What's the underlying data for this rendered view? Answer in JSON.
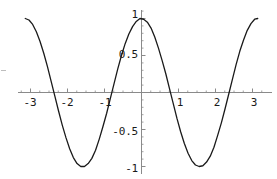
{
  "chart_data": {
    "type": "line",
    "title": "",
    "subtitle": "",
    "xlabel": "",
    "ylabel": "",
    "function": "cos(2x)",
    "xlim": [
      -3.4,
      3.4
    ],
    "ylim": [
      -1.18,
      1.18
    ],
    "grid": false,
    "legend": null,
    "axis_style": "crossed-at-origin",
    "x_ticks": [
      -3,
      -2,
      -1,
      1,
      2,
      3
    ],
    "x_tick_labels": [
      "-3",
      "-2",
      "-1",
      "1",
      "2",
      "3"
    ],
    "y_ticks": [
      1,
      0.5,
      -0.5,
      -1
    ],
    "y_tick_labels": [
      "1",
      "0.5",
      "-0.5",
      "-1"
    ],
    "x_minor_tick_step": 0.25,
    "y_minor_tick_step": 0.1,
    "series": [
      {
        "name": "cos(2x)",
        "color": "#1a1a1a",
        "width": 1.3,
        "x": [
          -3.1416,
          -3.0416,
          -2.9416,
          -2.8416,
          -2.7416,
          -2.6416,
          -2.5416,
          -2.4416,
          -2.3416,
          -2.2416,
          -2.1416,
          -2.0416,
          -1.9416,
          -1.8416,
          -1.7416,
          -1.6416,
          -1.5416,
          -1.4416,
          -1.3416,
          -1.2416,
          -1.1416,
          -1.0416,
          -0.9416,
          -0.8416,
          -0.7416,
          -0.6416,
          -0.5416,
          -0.4416,
          -0.3416,
          -0.2416,
          -0.1416,
          -0.0416,
          0.0584,
          0.1584,
          0.2584,
          0.3584,
          0.4584,
          0.5584,
          0.6584,
          0.7584,
          0.8584,
          0.9584,
          1.0584,
          1.1584,
          1.2584,
          1.3584,
          1.4584,
          1.5584,
          1.6584,
          1.7584,
          1.8584,
          1.9584,
          2.0584,
          2.1584,
          2.2584,
          2.3584,
          2.4584,
          2.5584,
          2.6584,
          2.7584,
          2.8584,
          2.9584,
          3.0584,
          3.1416
        ],
        "y": [
          1.0,
          0.98,
          0.92,
          0.82,
          0.69,
          0.53,
          0.35,
          0.15,
          -0.05,
          -0.25,
          -0.44,
          -0.61,
          -0.76,
          -0.88,
          -0.96,
          -1.0,
          -1.0,
          -0.96,
          -0.89,
          -0.78,
          -0.63,
          -0.46,
          -0.28,
          -0.08,
          0.12,
          0.32,
          0.5,
          0.66,
          0.79,
          0.89,
          0.96,
          1.0,
          0.99,
          0.95,
          0.87,
          0.75,
          0.6,
          0.43,
          0.25,
          0.05,
          -0.15,
          -0.35,
          -0.53,
          -0.69,
          -0.82,
          -0.92,
          -0.98,
          -1.0,
          -0.99,
          -0.94,
          -0.86,
          -0.74,
          -0.58,
          -0.41,
          -0.22,
          -0.02,
          0.18,
          0.38,
          0.56,
          0.71,
          0.84,
          0.93,
          0.99,
          1.0
        ]
      }
    ],
    "colors": {
      "curve": "#1a1a1a",
      "axis": "#8a8a8a",
      "tick": "#8a8a8a",
      "label": "#1a1a1a",
      "background": "#ffffff"
    }
  }
}
